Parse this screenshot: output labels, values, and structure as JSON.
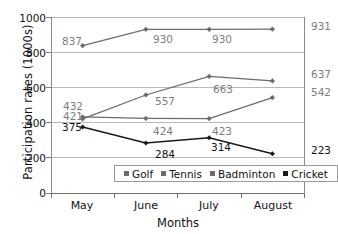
{
  "chart_data": {
    "type": "line",
    "title": "",
    "xlabel": "Months",
    "ylabel": "Participation rates (1000s)",
    "categories": [
      "May",
      "June",
      "July",
      "August"
    ],
    "ylim": [
      0,
      1000
    ],
    "yticks": [
      1000,
      800,
      600,
      400,
      200,
      0
    ],
    "grid": "horizontal",
    "legend_position": "inside-bottom-center",
    "series": [
      {
        "name": "Golf",
        "color": "#6b6b6b",
        "values": [
          837,
          930,
          930,
          931
        ],
        "labels": [
          "837",
          "930",
          "930",
          "931"
        ]
      },
      {
        "name": "Tennis",
        "color": "#6b6b6b",
        "values": [
          421,
          557,
          663,
          637
        ],
        "labels": [
          "421",
          "557",
          "663",
          "637"
        ]
      },
      {
        "name": "Badminton",
        "color": "#6b6b6b",
        "values": [
          432,
          424,
          423,
          542
        ],
        "labels": [
          "432",
          "424",
          "423",
          "542"
        ]
      },
      {
        "name": "Cricket",
        "color": "#1a1a1a",
        "values": [
          375,
          284,
          314,
          223
        ],
        "labels": [
          "375",
          "284",
          "314",
          "223"
        ]
      }
    ]
  },
  "axes": {
    "y_title": "Participation rates (1000s)",
    "x_title": "Months",
    "y_tick_labels": [
      "1000",
      "800",
      "600",
      "400",
      "200",
      "0"
    ],
    "x_tick_labels": [
      "May",
      "June",
      "July",
      "August"
    ]
  },
  "legend": {
    "items": [
      {
        "label": "Golf",
        "color": "#6b6b6b"
      },
      {
        "label": "Tennis",
        "color": "#6b6b6b"
      },
      {
        "label": "Badminton",
        "color": "#6b6b6b"
      },
      {
        "label": "Cricket",
        "color": "#1a1a1a"
      }
    ]
  },
  "colors": {
    "grey_series": "#6b6b6b",
    "dark_series": "#1a1a1a",
    "grid": "#b9b9b9",
    "axis": "#6f6f6f",
    "grey_label": "#7d7d7d",
    "dark_label": "#111111",
    "background": "#ffffff"
  },
  "point_labels": [
    {
      "text": "837",
      "tone": "grey",
      "left": 62,
      "top": 36
    },
    {
      "text": "930",
      "tone": "grey",
      "left": 153,
      "top": 34
    },
    {
      "text": "930",
      "tone": "grey",
      "left": 212,
      "top": 34
    },
    {
      "text": "931",
      "tone": "grey",
      "left": 311,
      "top": 21
    },
    {
      "text": "432",
      "tone": "grey",
      "left": 63,
      "top": 101
    },
    {
      "text": "421",
      "tone": "grey",
      "left": 63,
      "top": 111
    },
    {
      "text": "375",
      "tone": "dark",
      "left": 62,
      "top": 122
    },
    {
      "text": "557",
      "tone": "grey",
      "left": 155,
      "top": 96
    },
    {
      "text": "424",
      "tone": "grey",
      "left": 153,
      "top": 126
    },
    {
      "text": "284",
      "tone": "dark",
      "left": 155,
      "top": 149
    },
    {
      "text": "663",
      "tone": "grey",
      "left": 213,
      "top": 84
    },
    {
      "text": "423",
      "tone": "grey",
      "left": 212,
      "top": 126
    },
    {
      "text": "314",
      "tone": "dark",
      "left": 211,
      "top": 142
    },
    {
      "text": "637",
      "tone": "grey",
      "left": 311,
      "top": 69
    },
    {
      "text": "542",
      "tone": "grey",
      "left": 311,
      "top": 87
    },
    {
      "text": "223",
      "tone": "dark",
      "left": 311,
      "top": 145
    }
  ]
}
